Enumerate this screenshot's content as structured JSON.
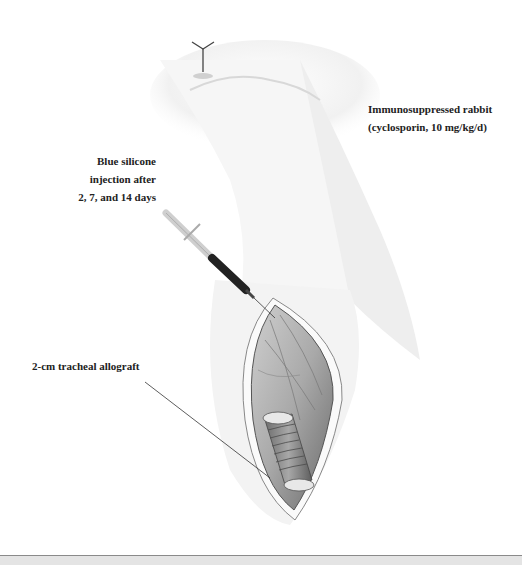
{
  "figure": {
    "labels": {
      "rabbit": {
        "line1": "Immunosuppressed rabbit",
        "line2": "(cyclosporin, 10 mg/kg/d)"
      },
      "injection": {
        "line1": "Blue silicone",
        "line2": "injection after",
        "line3": "2, 7, and 14 days"
      },
      "allograft": {
        "line1": "2-cm tracheal allograft"
      }
    },
    "elements": [
      "rabbit-head-illustration",
      "syringe",
      "neck-incision",
      "tracheal-allograft",
      "leader-line"
    ]
  }
}
